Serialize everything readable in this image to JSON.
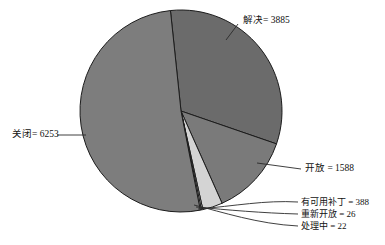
{
  "chart_data": {
    "type": "pie",
    "title": "",
    "subtitle": "",
    "xlabel": "",
    "ylabel": "",
    "legend_position": "none",
    "grid": false,
    "total": 12162,
    "label_separator": "=",
    "categories": [
      "关闭",
      "解决",
      "开放",
      "有可用补丁",
      "重新开放",
      "处理中"
    ],
    "values": [
      6253,
      3885,
      1588,
      388,
      26,
      22
    ],
    "slices": [
      {
        "name": "resolved",
        "label": "解决= 3885",
        "category": "解决",
        "value": 3885,
        "percent": 31.9,
        "color": "#6b6b6b",
        "start_angle": -6,
        "end_angle": 109,
        "label_x": 243,
        "label_y": 21,
        "leader": "M 238 24 L 226 40"
      },
      {
        "name": "open",
        "label": "开放 = 1588",
        "category": "开放",
        "value": 1588,
        "percent": 13.1,
        "color": "#7a7a7a",
        "start_angle": 109,
        "end_angle": 156,
        "label_x": 305,
        "label_y": 169,
        "leader": "M 301 169 L 257 163"
      },
      {
        "name": "patch-available",
        "label": "有可用补丁 = 388",
        "category": "有可用补丁",
        "value": 388,
        "percent": 3.2,
        "color": "#d4d4d4",
        "start_angle": 156,
        "end_angle": 167.5,
        "label_x": 301,
        "label_y": 203,
        "leader": "M 298 202 C 265 200 235 206 198 209"
      },
      {
        "name": "reopened",
        "label": "重新开放 = 26",
        "category": "重新开放",
        "value": 26,
        "percent": 0.2,
        "color": "#f2f2f2",
        "start_angle": 167.5,
        "end_angle": 168.3,
        "label_x": 301,
        "label_y": 215,
        "leader": "M 298 214 C 262 213 228 210 196 207"
      },
      {
        "name": "in-progress",
        "label": "处理中 = 22",
        "category": "处理中",
        "value": 22,
        "percent": 0.18,
        "color": "#ffffff",
        "start_angle": 168.3,
        "end_angle": 169,
        "label_x": 301,
        "label_y": 227,
        "leader": "M 298 226 C 258 224 222 212 194 205"
      },
      {
        "name": "closed",
        "label": "关闭= 6253",
        "category": "关闭",
        "value": 6253,
        "percent": 51.4,
        "color": "#7d7d7d",
        "start_angle": 169,
        "end_angle": 354,
        "label_x": 12,
        "label_y": 135,
        "leader": "M 57 135 L 86 135"
      }
    ],
    "geometry": {
      "center_x": 181,
      "center_y": 111,
      "radius": 101
    },
    "colors": {
      "outline": "#1c1c1c",
      "background": "#ffffff",
      "text": "#111111"
    }
  }
}
